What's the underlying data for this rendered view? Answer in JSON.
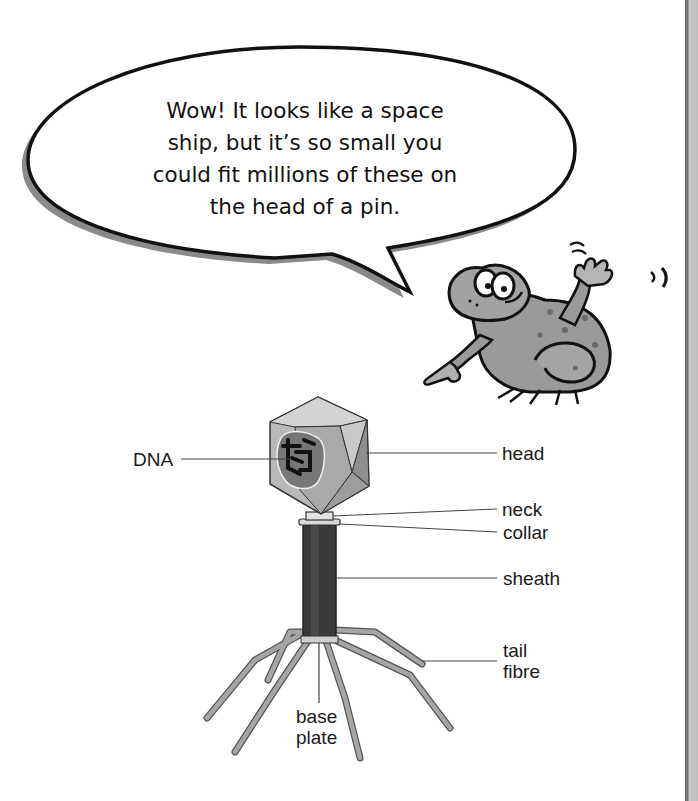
{
  "speech_bubble": {
    "lines": [
      "Wow! It looks like a space",
      "ship, but it’s so small you",
      "could fit millions of these on",
      "the head of a pin."
    ]
  },
  "character": {
    "name": "frog-mascot",
    "pose": "waving and pointing"
  },
  "diagram": {
    "labels": {
      "dna": "DNA",
      "head": "head",
      "neck": "neck",
      "collar": "collar",
      "sheath": "sheath",
      "tail_fibre_1": "tail",
      "tail_fibre_2": "fibre",
      "base_plate_1": "base",
      "base_plate_2": "plate"
    }
  },
  "colors": {
    "ink": "#111111",
    "head_light": "#c4c4c4",
    "head_mid": "#a8a8a8",
    "sheath": "#3c3c3c",
    "fibre": "#9a9a9a",
    "frog": "#8f8f8f"
  }
}
